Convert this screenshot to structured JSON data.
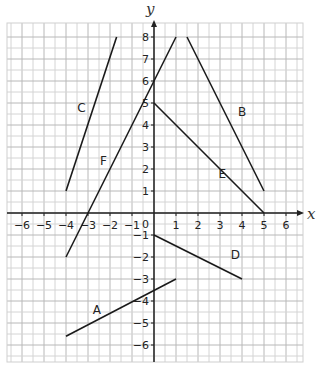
{
  "chart_data": {
    "type": "line",
    "title": "",
    "xlabel": "x",
    "ylabel": "y",
    "xlim": [
      -6.7,
      6.7
    ],
    "ylim": [
      -6.8,
      8.6
    ],
    "grid": true,
    "grid_minor_step": 0.5,
    "x_ticks": [
      -6,
      -5,
      -4,
      -3,
      -2,
      -1,
      1,
      2,
      3,
      4,
      5,
      6
    ],
    "x_tick_labels": [
      "−6",
      "−5",
      "−4",
      "−3",
      "−2",
      "−1",
      "1",
      "2",
      "3",
      "4",
      "5",
      "6"
    ],
    "y_ticks": [
      8,
      7,
      6,
      5,
      4,
      3,
      2,
      1,
      -1,
      -2,
      -3,
      -4,
      -5,
      -6
    ],
    "y_tick_labels": [
      "8",
      "7",
      "6",
      "5",
      "4",
      "3",
      "2",
      "1",
      "−1",
      "−2",
      "−3",
      "−4",
      "−5",
      "−6"
    ],
    "origin_label": "0",
    "series": [
      {
        "name": "A",
        "points": [
          [
            -4,
            -5.6
          ],
          [
            1,
            -3
          ]
        ],
        "label_pos": [
          -2.6,
          -4.6
        ]
      },
      {
        "name": "B",
        "points": [
          [
            1.5,
            8
          ],
          [
            5,
            1
          ]
        ],
        "label_pos": [
          4,
          4.4
        ]
      },
      {
        "name": "C",
        "points": [
          [
            -4,
            1
          ],
          [
            -1.7,
            8
          ]
        ],
        "label_pos": [
          -3.3,
          4.6
        ]
      },
      {
        "name": "D",
        "points": [
          [
            0,
            -1
          ],
          [
            4,
            -3
          ]
        ],
        "label_pos": [
          3.7,
          -2.1
        ]
      },
      {
        "name": "E",
        "points": [
          [
            0,
            5
          ],
          [
            5,
            0
          ]
        ],
        "label_pos": [
          3.1,
          1.6
        ]
      },
      {
        "name": "F",
        "points": [
          [
            -4,
            -2
          ],
          [
            1,
            8
          ]
        ],
        "label_pos": [
          -2.3,
          2.2
        ]
      }
    ]
  },
  "axes": {
    "x_label": "x",
    "y_label": "y"
  }
}
